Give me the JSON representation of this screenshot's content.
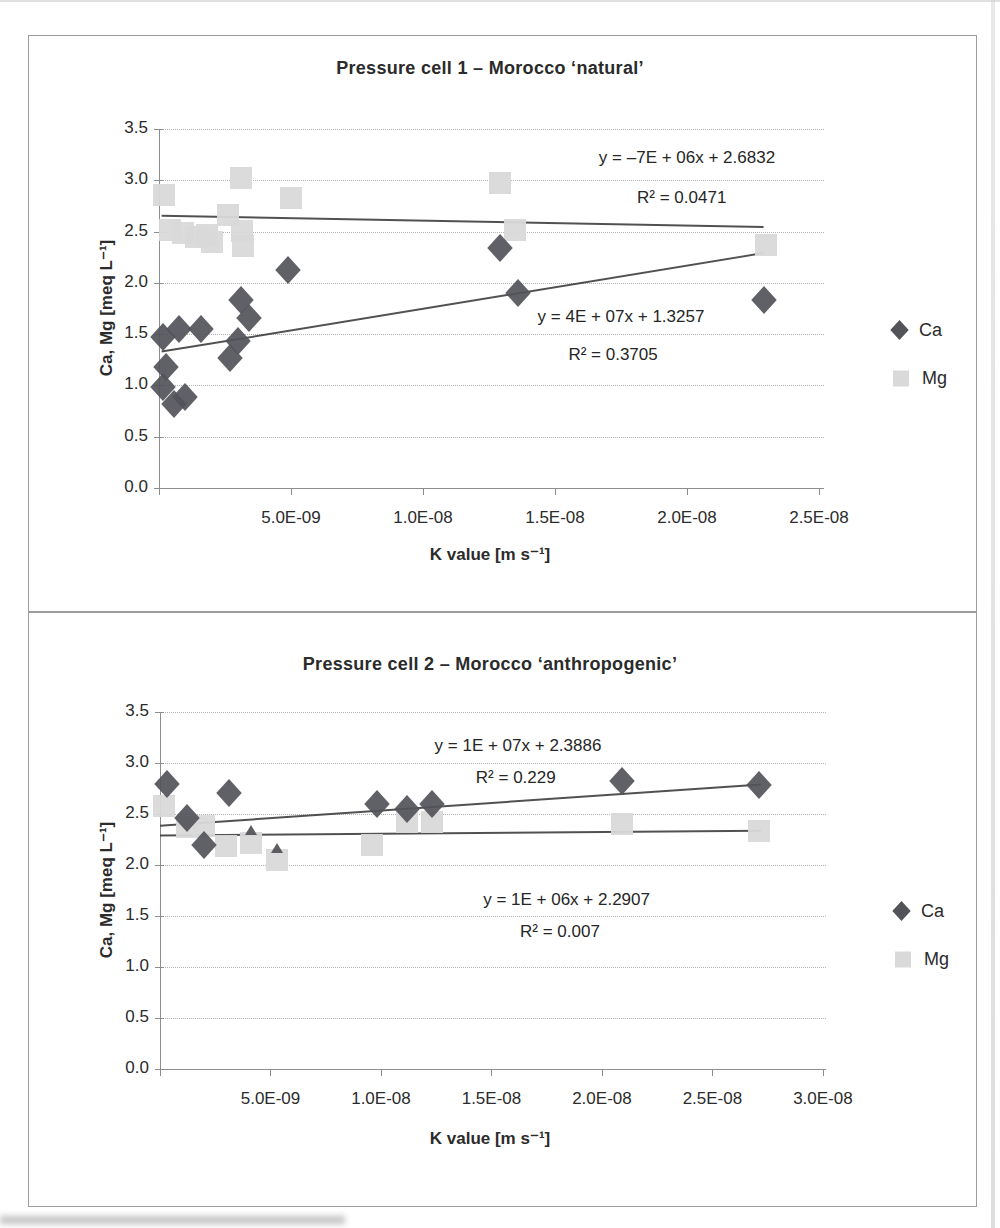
{
  "chart_data": [
    {
      "type": "scatter",
      "title": "Pressure cell 1 – Morocco ‘natural’",
      "xlabel": "K value [m s⁻¹]",
      "ylabel": "Ca, Mg [meq L⁻¹]",
      "xlim": [
        0,
        2.519e-08
      ],
      "ylim": [
        0,
        3.5
      ],
      "grid": "horizontal-dotted",
      "legend_position": "right",
      "plot": {
        "left": 159,
        "right": 824,
        "top": 129,
        "bottom": 488
      },
      "x_ticks": [
        {
          "value": 5e-09,
          "label": "5.0E-09"
        },
        {
          "value": 1e-08,
          "label": "1.0E-08"
        },
        {
          "value": 1.5e-08,
          "label": "1.5E-08"
        },
        {
          "value": 2e-08,
          "label": "2.0E-08"
        },
        {
          "value": 2.5e-08,
          "label": "2.5E-08"
        }
      ],
      "y_ticks": [
        {
          "value": 3.5,
          "label": "3.5"
        },
        {
          "value": 3.0,
          "label": "3.0"
        },
        {
          "value": 2.5,
          "label": "2.5"
        },
        {
          "value": 2.0,
          "label": "2.0"
        },
        {
          "value": 1.5,
          "label": "1.5"
        },
        {
          "value": 1.0,
          "label": "1.0"
        },
        {
          "value": 0.5,
          "label": "0.5"
        },
        {
          "value": 0.0,
          "label": "0.0"
        }
      ],
      "series": [
        {
          "name": "Ca",
          "marker": "diamond",
          "color": "#53535a",
          "points": [
            [
              1.5e-10,
              1.47
            ],
            [
              7.6e-10,
              1.55
            ],
            [
              1.6e-09,
              1.55
            ],
            [
              2.7e-10,
              1.18
            ],
            [
              1.5e-10,
              0.98
            ],
            [
              5.7e-10,
              0.82
            ],
            [
              1e-09,
              0.89
            ],
            [
              2.7e-09,
              1.27
            ],
            [
              3e-09,
              1.43
            ],
            [
              3.1e-09,
              1.83
            ],
            [
              3.4e-09,
              1.66
            ],
            [
              4.9e-09,
              2.13
            ],
            [
              1.29e-08,
              2.34
            ],
            [
              1.36e-08,
              1.9
            ],
            [
              2.29e-08,
              1.83
            ]
          ]
        },
        {
          "name": "Mg",
          "marker": "square",
          "color": "#d9d9d9",
          "points": [
            [
              2e-10,
              2.86
            ],
            [
              4e-10,
              2.52
            ],
            [
              9e-10,
              2.49
            ],
            [
              1.4e-09,
              2.45
            ],
            [
              1.8e-09,
              2.47
            ],
            [
              2e-09,
              2.4
            ],
            [
              2.6e-09,
              2.66
            ],
            [
              3.1e-09,
              3.02
            ],
            [
              3.15e-09,
              2.51
            ],
            [
              3.2e-09,
              2.36
            ],
            [
              5e-09,
              2.83
            ],
            [
              1.29e-08,
              2.97
            ],
            [
              1.35e-08,
              2.52
            ],
            [
              2.3e-08,
              2.37
            ]
          ]
        }
      ],
      "trendlines": [
        {
          "series": "Mg",
          "x1": 1e-10,
          "y1": 2.655,
          "x2": 2.29e-08,
          "y2": 2.545,
          "equation": "y = –7E + 06x + 2.6832",
          "r2": "R² = 0.0471",
          "eq_anchor": [
            2e-08,
            3.22
          ],
          "r2_anchor": [
            1.98e-08,
            2.83
          ]
        },
        {
          "series": "Ca",
          "x1": 1e-10,
          "y1": 1.33,
          "x2": 2.29e-08,
          "y2": 2.29,
          "equation": "y = 4E + 07x + 1.3257",
          "r2": "R² = 0.3705",
          "eq_anchor": [
            1.75e-08,
            1.67
          ],
          "r2_anchor": [
            1.72e-08,
            1.3
          ]
        }
      ],
      "legend": {
        "items": [
          {
            "label": "Ca",
            "marker": "diamond",
            "x": 893,
            "y": 330
          },
          {
            "label": "Mg",
            "marker": "square",
            "x": 893,
            "y": 378
          }
        ]
      }
    },
    {
      "type": "scatter",
      "title": "Pressure cell 2 – Morocco ‘anthropogenic’",
      "xlabel": "K value [m s⁻¹]",
      "ylabel": "Ca, Mg [meq L⁻¹]",
      "xlim": [
        0,
        3.014e-08
      ],
      "ylim": [
        0,
        3.5
      ],
      "grid": "horizontal-dotted",
      "legend_position": "right",
      "plot": {
        "left": 160,
        "right": 826,
        "top": 712,
        "bottom": 1069
      },
      "x_ticks": [
        {
          "value": 5e-09,
          "label": "5.0E-09"
        },
        {
          "value": 1e-08,
          "label": "1.0E-08"
        },
        {
          "value": 1.5e-08,
          "label": "1.5E-08"
        },
        {
          "value": 2e-08,
          "label": "2.0E-08"
        },
        {
          "value": 2.5e-08,
          "label": "2.5E-08"
        },
        {
          "value": 3e-08,
          "label": "3.0E-08"
        }
      ],
      "y_ticks": [
        {
          "value": 3.5,
          "label": "3.5"
        },
        {
          "value": 3.0,
          "label": "3.0"
        },
        {
          "value": 2.5,
          "label": "2.5"
        },
        {
          "value": 2.0,
          "label": "2.0"
        },
        {
          "value": 1.5,
          "label": "1.5"
        },
        {
          "value": 1.0,
          "label": "1.0"
        },
        {
          "value": 0.5,
          "label": "0.5"
        },
        {
          "value": 0.0,
          "label": "0.0"
        }
      ],
      "series": [
        {
          "name": "Ca",
          "marker": "diamond",
          "color": "#53535a",
          "points": [
            [
              3e-10,
              2.79
            ],
            [
              1.2e-09,
              2.46
            ],
            [
              2e-09,
              2.2
            ],
            [
              3.1e-09,
              2.71
            ],
            [
              9.8e-09,
              2.6
            ],
            [
              1.12e-08,
              2.55
            ],
            [
              1.23e-08,
              2.6
            ],
            [
              2.09e-08,
              2.82
            ],
            [
              2.71e-08,
              2.78
            ]
          ]
        },
        {
          "name": "Mg",
          "marker": "square",
          "color": "#d9d9d9",
          "points": [
            [
              2e-10,
              2.58
            ],
            [
              1.2e-09,
              2.37
            ],
            [
              2e-09,
              2.38
            ],
            [
              3e-09,
              2.19
            ],
            [
              4.1e-09,
              2.22
            ],
            [
              5.3e-09,
              2.05
            ],
            [
              9.6e-09,
              2.2
            ],
            [
              1.12e-08,
              2.42
            ],
            [
              1.23e-08,
              2.42
            ],
            [
              2.09e-08,
              2.4
            ],
            [
              2.71e-08,
              2.33
            ]
          ]
        }
      ],
      "extra_marks": [
        {
          "x": 4.1e-09,
          "y": 2.34
        },
        {
          "x": 5.3e-09,
          "y": 2.17
        }
      ],
      "trendlines": [
        {
          "series": "Ca",
          "x1": 0,
          "y1": 2.385,
          "x2": 2.72e-08,
          "y2": 2.79,
          "equation": "y = 1E + 07x + 2.3886",
          "r2": "R² = 0.229",
          "eq_anchor": [
            1.62e-08,
            3.17
          ],
          "r2_anchor": [
            1.61e-08,
            2.85
          ]
        },
        {
          "series": "Mg",
          "x1": 0,
          "y1": 2.29,
          "x2": 2.72e-08,
          "y2": 2.335,
          "equation": "y = 1E + 06x + 2.2907",
          "r2": "R² = 0.007",
          "eq_anchor": [
            1.84e-08,
            1.66
          ],
          "r2_anchor": [
            1.81e-08,
            1.34
          ]
        }
      ],
      "legend": {
        "items": [
          {
            "label": "Ca",
            "marker": "diamond",
            "x": 895,
            "y": 911
          },
          {
            "label": "Mg",
            "marker": "square",
            "x": 895,
            "y": 959
          }
        ]
      }
    }
  ],
  "style": {
    "ca_color": "#53535a",
    "mg_color": "#d9d9d9",
    "trendline_color": "#333333",
    "gridline_color": "#b2b2b2",
    "axis_color": "#8d8d8d",
    "text_color": "#2b2b2b",
    "panel_border_color": "#9c9c9c"
  }
}
